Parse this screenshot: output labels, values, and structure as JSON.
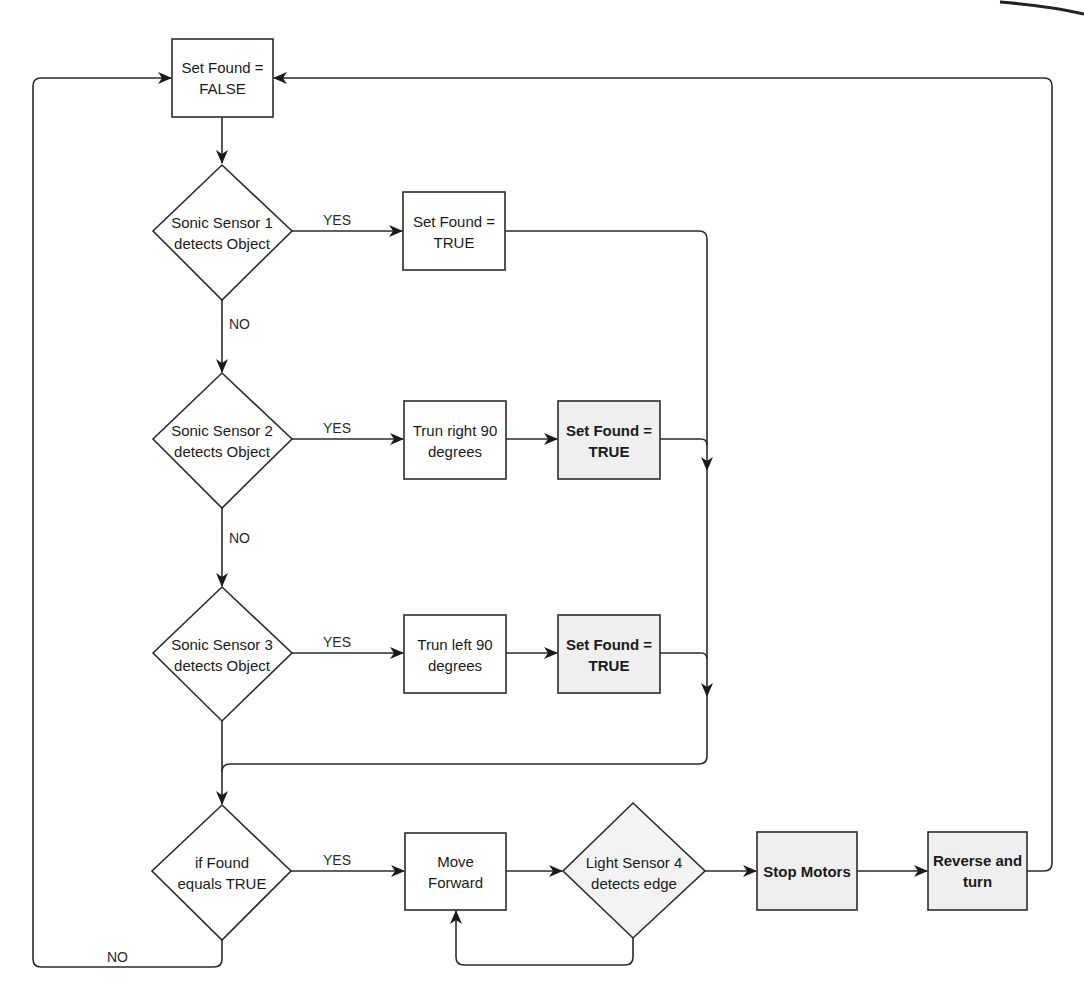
{
  "diagram": {
    "type": "flowchart",
    "colors": {
      "stroke": "#2b2b2b",
      "plain_fill": "#ffffff",
      "shaded_fill": "#efefef",
      "text": "#1a1a1a"
    },
    "nodes": {
      "set_found_false": {
        "shape": "process",
        "line1": "Set Found =",
        "line2": "FALSE"
      },
      "sonic1": {
        "shape": "decision",
        "line1": "Sonic Sensor 1",
        "line2": "detects Object"
      },
      "set_found_true_1": {
        "shape": "process",
        "line1": "Set Found =",
        "line2": "TRUE"
      },
      "sonic2": {
        "shape": "decision",
        "line1": "Sonic Sensor 2",
        "line2": "detects Object"
      },
      "turn_right": {
        "shape": "process",
        "line1": "Trun right 90",
        "line2": "degrees"
      },
      "set_found_true_2": {
        "shape": "process",
        "shaded": true,
        "line1": "Set Found =",
        "line2": "TRUE"
      },
      "sonic3": {
        "shape": "decision",
        "line1": "Sonic Sensor 3",
        "line2": "detects Object"
      },
      "turn_left": {
        "shape": "process",
        "line1": "Trun left 90",
        "line2": "degrees"
      },
      "set_found_true_3": {
        "shape": "process",
        "shaded": true,
        "line1": "Set Found =",
        "line2": "TRUE"
      },
      "if_found": {
        "shape": "decision",
        "line1": "if Found",
        "line2": "equals TRUE"
      },
      "move_forward": {
        "shape": "process",
        "line1": "Move",
        "line2": "Forward"
      },
      "light4": {
        "shape": "decision",
        "shaded": true,
        "line1": "Light Sensor 4",
        "line2": "detects edge"
      },
      "stop_motors": {
        "shape": "process",
        "shaded": true,
        "line1": "Stop Motors"
      },
      "reverse_turn": {
        "shape": "process",
        "shaded": true,
        "line1": "Reverse and",
        "line2": "turn"
      }
    },
    "edge_labels": {
      "sonic1_yes": "YES",
      "sonic1_no": "NO",
      "sonic2_yes": "YES",
      "sonic2_no": "NO",
      "sonic3_yes": "YES",
      "if_found_yes": "YES",
      "if_found_no": "NO"
    },
    "edges": [
      {
        "from": "set_found_false",
        "to": "sonic1"
      },
      {
        "from": "sonic1",
        "to": "set_found_true_1",
        "label": "YES"
      },
      {
        "from": "sonic1",
        "to": "sonic2",
        "label": "NO"
      },
      {
        "from": "sonic2",
        "to": "turn_right",
        "label": "YES"
      },
      {
        "from": "turn_right",
        "to": "set_found_true_2"
      },
      {
        "from": "sonic2",
        "to": "sonic3",
        "label": "NO"
      },
      {
        "from": "sonic3",
        "to": "turn_left",
        "label": "YES"
      },
      {
        "from": "turn_left",
        "to": "set_found_true_3"
      },
      {
        "from": "set_found_true_1",
        "to": "if_found"
      },
      {
        "from": "set_found_true_2",
        "to": "if_found"
      },
      {
        "from": "set_found_true_3",
        "to": "if_found"
      },
      {
        "from": "sonic3",
        "to": "if_found"
      },
      {
        "from": "if_found",
        "to": "move_forward",
        "label": "YES"
      },
      {
        "from": "if_found",
        "to": "set_found_false",
        "label": "NO"
      },
      {
        "from": "move_forward",
        "to": "light4"
      },
      {
        "from": "light4",
        "to": "stop_motors"
      },
      {
        "from": "light4",
        "to": "move_forward"
      },
      {
        "from": "stop_motors",
        "to": "reverse_turn"
      },
      {
        "from": "reverse_turn",
        "to": "set_found_false"
      }
    ]
  }
}
